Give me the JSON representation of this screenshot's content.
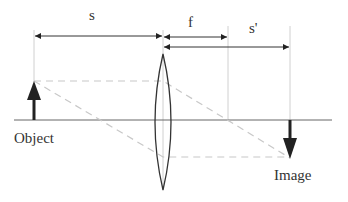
{
  "diagram": {
    "labels": {
      "object_distance": "s",
      "focal_length": "f",
      "image_distance": "s'",
      "object": "Object",
      "image": "Image"
    },
    "colors": {
      "line": "#333333",
      "guide": "#cfcfcf",
      "ray": "#c8c8c8",
      "axis": "#555555",
      "fill": "#222222"
    },
    "geometry": {
      "axis_y": 120,
      "object_x": 34,
      "object_tip_y": 81,
      "lens_x": 163,
      "lens_top_y": 55,
      "lens_bottom_y": 190,
      "focal_x": 228,
      "image_x": 290,
      "image_tip_y": 158
    }
  }
}
